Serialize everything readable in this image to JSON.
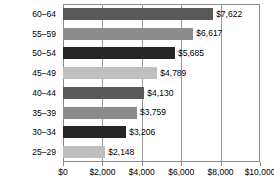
{
  "chart_data": {
    "type": "bar",
    "orientation": "horizontal",
    "title": "",
    "subtitle": "",
    "xlabel": "",
    "ylabel": "",
    "xlim": [
      0,
      10000
    ],
    "ylim": null,
    "grid": true,
    "legend": false,
    "legend_position": "none",
    "categories": [
      "60–64",
      "55–59",
      "50–54",
      "45–49",
      "40–44",
      "35–39",
      "30–34",
      "25–29"
    ],
    "values": [
      7622,
      6617,
      5685,
      4789,
      4130,
      3759,
      3206,
      2148
    ],
    "data_labels": [
      "$7,622",
      "$6,617",
      "$5,685",
      "$4,789",
      "$4,130",
      "$3,759",
      "$3,206",
      "$2,148"
    ],
    "bar_colors": [
      "#595959",
      "#8c8c8c",
      "#262626",
      "#bfbfbf",
      "#595959",
      "#8c8c8c",
      "#262626",
      "#bfbfbf"
    ],
    "xticks": [
      0,
      2000,
      4000,
      6000,
      8000,
      10000
    ],
    "xtick_labels": [
      "$0",
      "$2,000",
      "$4,000",
      "$6,000",
      "$8,000",
      "$10,000"
    ],
    "axis_color": "#8a8a8a",
    "grid_color": "#9a9a9a",
    "text_color": "#000000",
    "background": "#ffffff"
  }
}
